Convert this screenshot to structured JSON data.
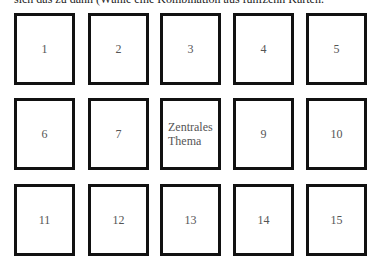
{
  "header": {
    "text": "sich das zu dann (Wähle eine Kombination aus fünfzehn Karten."
  },
  "grid": {
    "rows": 3,
    "columns": 5,
    "cards": [
      {
        "label": "1"
      },
      {
        "label": "2"
      },
      {
        "label": "3"
      },
      {
        "label": "4"
      },
      {
        "label": "5"
      },
      {
        "label": "6"
      },
      {
        "label": "7"
      },
      {
        "label": "Zentrales Thema",
        "line1": "Zentrales",
        "line2": "Thema"
      },
      {
        "label": "9"
      },
      {
        "label": "10"
      },
      {
        "label": "11"
      },
      {
        "label": "12"
      },
      {
        "label": "13"
      },
      {
        "label": "14"
      },
      {
        "label": "15"
      }
    ]
  },
  "colors": {
    "card_border": "#111111",
    "card_text": "#555555",
    "background": "#ffffff"
  }
}
